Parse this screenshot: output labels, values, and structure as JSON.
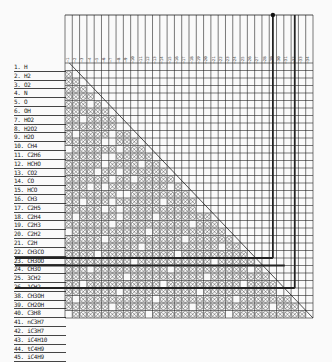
{
  "chart_data": {
    "type": "table",
    "title": "",
    "rows": [
      "1. H",
      "2. H2",
      "3. O2",
      "4. N",
      "5. O",
      "6. OH",
      "7. HO2",
      "8. H2O2",
      "9. H2O",
      "10. CH4",
      "11. C2H6",
      "12. HCHO",
      "13. CO2",
      "14. CO",
      "15. HCO",
      "16. CH3",
      "17. C2H5",
      "18. C2H4",
      "19. C2H3",
      "20. C2H2",
      "21. C2H",
      "22. CH3CO",
      "23. CH3OO",
      "24. CH3O",
      "25. 3CH2",
      "26. 1CH2",
      "38. CH3OH",
      "39. CH2OH",
      "40. C3H8",
      "41. nC3H7",
      "42. iC3H7",
      "43. iC4H10",
      "44. tC4H9",
      "45. iC4H9"
    ],
    "column_count": 34,
    "grid": {
      "left": 65,
      "top": 63,
      "right": 313,
      "bottom": 318
    },
    "highlighted_rows": [
      26,
      27,
      30
    ],
    "highlighted_columns": [
      28,
      31
    ],
    "mark_symbol": "⊗"
  },
  "labels": [
    "1. H",
    "2. H2",
    "3. O2",
    "4. N",
    "5. O",
    "6. OH",
    "7. HO2",
    "8. H2O2",
    "9. H2O",
    "10. CH4",
    "11. C2H6",
    "12. HCHO",
    "13. CO2",
    "14. CO",
    "15. HCO",
    "16. CH3",
    "17. C2H5",
    "18. C2H4",
    "19. C2H3",
    "20. C2H2",
    "21. C2H",
    "22. CH3CO",
    "23. CH3OO",
    "24. CH3O",
    "25. 3CH2",
    "26. 1CH2",
    "38. CH3OH",
    "39. CH2OH",
    "40. C3H8",
    "41. nC3H7",
    "42. iC3H7",
    "43. iC4H10",
    "44. tC4H9",
    "45. iC4H9"
  ],
  "colors": {
    "ink": "#222222",
    "paper": "#fafafa",
    "mark": "#333333"
  }
}
